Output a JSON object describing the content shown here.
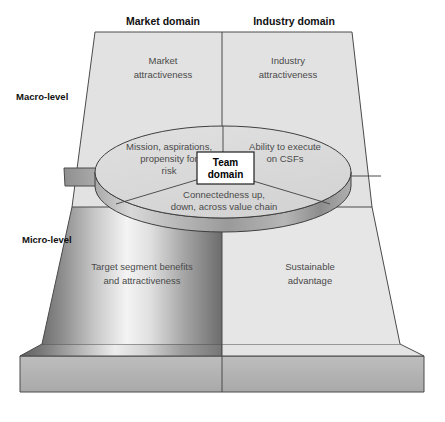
{
  "figure": {
    "title_top_left": "Market domain",
    "title_top_right": "Industry domain",
    "level_upper": "Macro-level",
    "level_lower": "Micro-level"
  },
  "quadrants": {
    "macro_market_line1": "Market",
    "macro_market_line2": "attractiveness",
    "macro_industry_line1": "Industry",
    "macro_industry_line2": "attractiveness",
    "micro_market_line1": "Target segment benefits",
    "micro_market_line2": "and attractiveness",
    "micro_industry_line1": "Sustainable",
    "micro_industry_line2": "advantage"
  },
  "team": {
    "box_line1": "Team",
    "box_line2": "domain",
    "sector_left_line1": "Mission, aspirations,",
    "sector_left_line2": "propensity for",
    "sector_left_line3": "risk",
    "sector_right_line1": "Ability to execute",
    "sector_right_line2": "on CSFs",
    "sector_bottom_line1": "Connectedness up,",
    "sector_bottom_line2": "down, across value chain"
  },
  "colors": {
    "panel_fill": "#e2e2e2",
    "panel_fill_light": "#e8e8e8",
    "stroke": "#3f3f3f",
    "stroke_light": "#6f6f6f",
    "disc_top": "#dcdcdc",
    "disc_rim_dark": "#8e8e8e",
    "disc_rim_light": "#d2d2d2",
    "base_side": "#b4b4b4",
    "waist_band": "#9a9a9a",
    "text": "#4a4a4a",
    "text_dark": "#111111",
    "box_fill": "#ffffff"
  }
}
